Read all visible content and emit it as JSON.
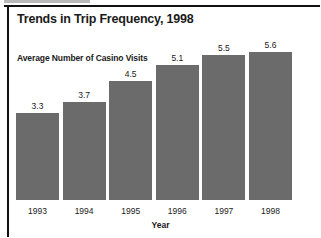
{
  "chart_data": {
    "type": "bar",
    "title": "Trends in Trip Frequency, 1998",
    "subtitle": "Average Number of Casino Visits",
    "xlabel": "Year",
    "ylabel": "",
    "categories": [
      "1993",
      "1994",
      "1995",
      "1996",
      "1997",
      "1998"
    ],
    "values": [
      3.3,
      3.7,
      4.5,
      5.1,
      5.5,
      5.6
    ],
    "value_labels": [
      "3.3",
      "3.7",
      "4.5",
      "5.1",
      "5.5",
      "5.6"
    ],
    "ylim": [
      0,
      5.6
    ],
    "grid": false,
    "legend": null,
    "series": [
      {
        "name": "Average Number of Casino Visits",
        "values": [
          3.3,
          3.7,
          4.5,
          5.1,
          5.5,
          5.6
        ]
      }
    ],
    "colors": {
      "bar": "#6b6b6b",
      "text": "#1a1a1a",
      "frame": "#111111",
      "background": "#ffffff"
    }
  }
}
